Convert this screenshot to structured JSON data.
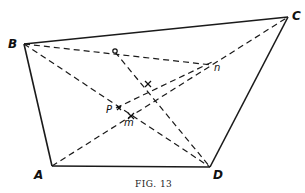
{
  "figure": {
    "caption": "FIG. 13",
    "vertices": {
      "A": {
        "label": "A",
        "x": 52,
        "y": 166
      },
      "B": {
        "label": "B",
        "x": 24,
        "y": 44
      },
      "C": {
        "label": "C",
        "x": 288,
        "y": 17
      },
      "D": {
        "label": "D",
        "x": 210,
        "y": 167
      }
    },
    "points": {
      "o": {
        "label": "o",
        "x": 115,
        "y": 52
      },
      "n": {
        "label": "n",
        "x": 212,
        "y": 65
      },
      "x": {
        "label": "x",
        "x": 140,
        "y": 82
      },
      "P": {
        "label": "P",
        "x": 116,
        "y": 107
      },
      "m": {
        "label": "m",
        "x": 131,
        "y": 116
      }
    },
    "solid_edges": [
      "A-B",
      "B-C",
      "C-D",
      "D-A"
    ],
    "dashed_lines": [
      "B-D",
      "A-C",
      "B-n",
      "n-C",
      "o-D",
      "P-n"
    ]
  }
}
